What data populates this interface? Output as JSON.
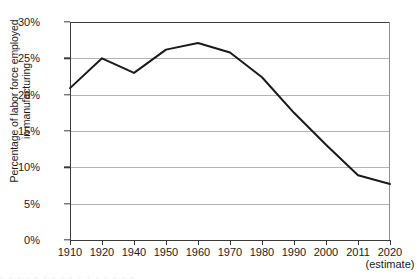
{
  "chart_data": {
    "type": "line",
    "title": "",
    "xlabel": "",
    "ylabel": "Percentage of labor force employed in manufacturing",
    "ylabel_line1": "Percentage of labor force employed",
    "ylabel_line2": "in manufacturing",
    "categories": [
      "1910",
      "1920",
      "1940",
      "1950",
      "1960",
      "1970",
      "1980",
      "1990",
      "2000",
      "2011",
      "2020"
    ],
    "values": [
      20.9,
      25.0,
      23.0,
      26.2,
      27.1,
      25.8,
      22.4,
      17.5,
      13.1,
      8.9,
      7.7
    ],
    "x_tick_labels": [
      "1910",
      "1920",
      "1940",
      "1950",
      "1960",
      "1970",
      "1980",
      "1990",
      "2000",
      "2011",
      "2020"
    ],
    "x_tick_note": "(estimate)",
    "x_tick_note_attached_to": "2020",
    "y_tick_labels": [
      "0%",
      "5%",
      "10%",
      "15%",
      "20%",
      "25%",
      "30%"
    ],
    "y_tick_values": [
      0,
      5,
      10,
      15,
      20,
      25,
      30
    ],
    "ylim": [
      0,
      30
    ],
    "grid": true,
    "grid_axis": "y",
    "legend": false,
    "legend_position": "none",
    "series_color": "#1a1a1a",
    "grid_color": "#b4b4b4",
    "axis_color": "#3b3b3b",
    "background_color": "#ffffff"
  },
  "caption_strip": "·  ·    ·    ·   ·  ·   ·   ·  ·  ·   ·  ·   ·  ·   ·   ·"
}
